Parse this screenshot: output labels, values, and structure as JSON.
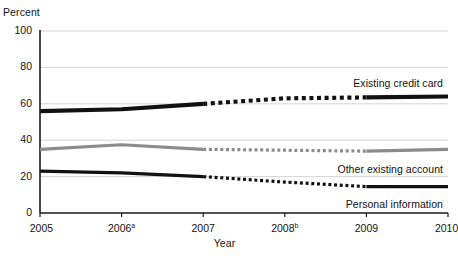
{
  "chart_data": {
    "type": "line",
    "title": "",
    "xlabel": "Year",
    "ylabel": "Percent",
    "x": [
      2005,
      2006,
      2007,
      2008,
      2009,
      2010
    ],
    "categories": [
      "2005",
      "2006",
      "2007",
      "2008",
      "2009",
      "2010"
    ],
    "xtick_labels": [
      "2005",
      "2006",
      "2007",
      "2008",
      "2009",
      "2010"
    ],
    "xtick_footnotes": [
      "",
      "a",
      "",
      "b",
      "",
      ""
    ],
    "ytick_labels": [
      "0",
      "20",
      "40",
      "60",
      "80",
      "100"
    ],
    "ytick_values": [
      0,
      20,
      40,
      60,
      80,
      100
    ],
    "ylim": [
      0,
      100
    ],
    "xlim": [
      2005,
      2010
    ],
    "grid": "horizontal",
    "legend_position": "inline-right-of-line",
    "dashed_range": [
      2007,
      2009
    ],
    "series": [
      {
        "name": "Existing credit card",
        "color": "#111111",
        "width": 4.2,
        "values": [
          56,
          57,
          60,
          63,
          63.5,
          64
        ]
      },
      {
        "name": "Other existing account",
        "color": "#8c8c8c",
        "width": 3.2,
        "values": [
          35,
          37.5,
          35,
          34.5,
          34,
          35
        ]
      },
      {
        "name": "Personal information",
        "color": "#111111",
        "width": 3.2,
        "values": [
          23,
          22,
          20,
          17,
          14.5,
          14.5
        ]
      }
    ]
  },
  "axes": {
    "y_title": "Percent",
    "x_title": "Year"
  },
  "colors": {
    "series_dark": "#111111",
    "series_gray": "#8c8c8c",
    "gridline": "#d4d4d4",
    "axis": "#1a1a1a",
    "background": "#ffffff"
  }
}
